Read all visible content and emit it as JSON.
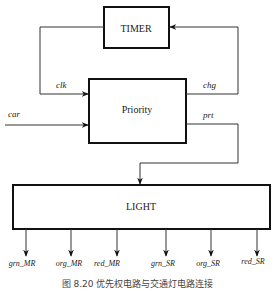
{
  "diagram": {
    "blocks": {
      "timer": "TIMER",
      "priority": "Priority",
      "light": "LIGHT"
    },
    "signals": {
      "clk": "clk",
      "chg": "chg",
      "car": "car",
      "prt": "prt"
    },
    "outputs": [
      "grn_MR",
      "org_MR",
      "red_MR",
      "grn_SR",
      "org_SR",
      "red_SR"
    ],
    "caption": "图 8.20   优先权电路与交通灯电路连接"
  }
}
